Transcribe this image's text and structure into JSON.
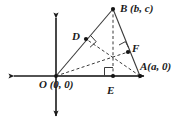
{
  "figure": {
    "background_color": "#ffffff",
    "stroke_color": "#1a1a1a",
    "axis_color": "#1a1a1a",
    "width": 179,
    "height": 129,
    "labels": {
      "vertex_b": "B (b, c)",
      "vertex_a": "A(a, 0)",
      "origin_o": "O (0, 0)",
      "foot_d": "D",
      "foot_f": "F",
      "foot_e": "E"
    },
    "points": {
      "O": {
        "x": 56,
        "y": 76,
        "name": "origin"
      },
      "A": {
        "x": 140,
        "y": 76,
        "name": "vertex-a"
      },
      "B": {
        "x": 113,
        "y": 9,
        "name": "vertex-b"
      },
      "D": {
        "x": 86,
        "y": 39,
        "name": "foot-d-on-ob"
      },
      "E": {
        "x": 113,
        "y": 76,
        "name": "foot-e-on-oa"
      },
      "F": {
        "x": 128,
        "y": 52,
        "name": "foot-f-on-ab"
      },
      "H": {
        "x": 113,
        "y": 57,
        "name": "orthocenter"
      }
    },
    "axes": {
      "x_axis": {
        "x1": 8,
        "y1": 76,
        "x2": 150,
        "y2": 76,
        "arrows": "both"
      },
      "y_axis": {
        "x1": 56,
        "y1": 12,
        "x2": 56,
        "y2": 122,
        "arrows": "both"
      }
    },
    "solid_segments": [
      {
        "name": "side-OB",
        "from": "O",
        "to": "B"
      },
      {
        "name": "side-OA",
        "from": "O",
        "to": "A"
      },
      {
        "name": "side-AB",
        "from": "A",
        "to": "B"
      }
    ],
    "dashed_segments": [
      {
        "name": "altitude-BE",
        "from": "B",
        "to": "E"
      },
      {
        "name": "altitude-AD",
        "from": "A",
        "to": "D"
      },
      {
        "name": "altitude-OF",
        "from": "O",
        "to": "F"
      }
    ],
    "right_angle_marks": [
      {
        "name": "right-angle-at-D",
        "x": 86,
        "y": 39
      },
      {
        "name": "right-angle-at-F",
        "x": 128,
        "y": 52
      },
      {
        "name": "right-angle-at-E",
        "x": 113,
        "y": 76
      }
    ]
  }
}
